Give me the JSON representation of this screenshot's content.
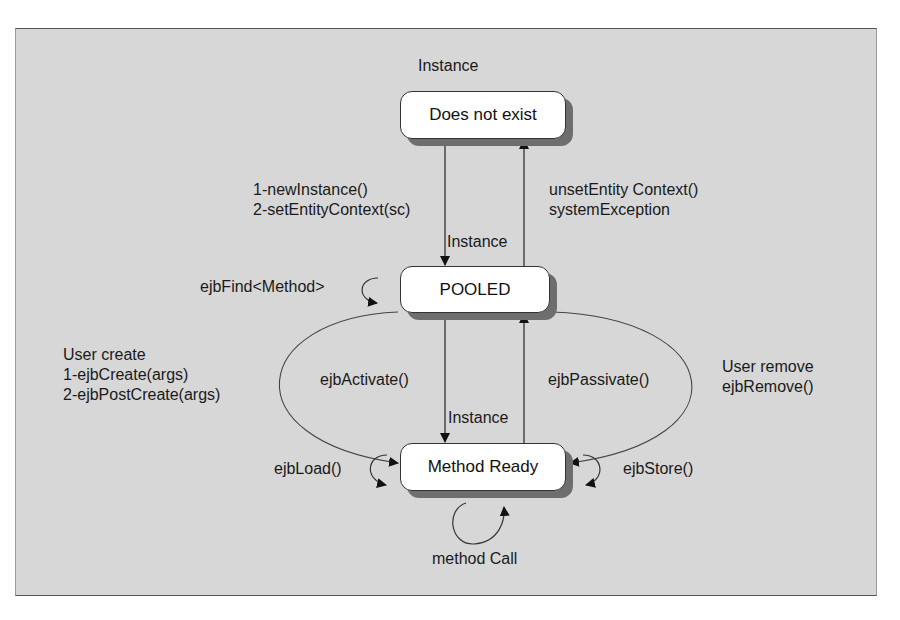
{
  "diagram": {
    "title": "Instance",
    "states": [
      {
        "id": "does-not-exist",
        "label": "Does not exist"
      },
      {
        "id": "pooled",
        "label": "POOLED"
      },
      {
        "id": "method-ready",
        "label": "Method Ready"
      }
    ],
    "transitions": {
      "create_instance": {
        "line1": "1-newInstance()",
        "line2": "2-setEntityContext(sc)",
        "tag": "Instance"
      },
      "destroy_instance": {
        "line1": "unsetEntity Context()",
        "line2": "systemException"
      },
      "pooled_self": {
        "label": "ejbFind<Method>"
      },
      "user_create": {
        "line1": "User create",
        "line2": "1-ejbCreate(args)",
        "line3": "2-ejbPostCreate(args)"
      },
      "activate": {
        "label": "ejbActivate()",
        "tag": "Instance"
      },
      "passivate": {
        "label": "ejbPassivate()"
      },
      "user_remove": {
        "line1": "User remove",
        "line2": "ejbRemove()"
      },
      "load_self": {
        "label": "ejbLoad()"
      },
      "store_self": {
        "label": "ejbStore()"
      },
      "method_call_self": {
        "label": "method Call"
      }
    }
  }
}
